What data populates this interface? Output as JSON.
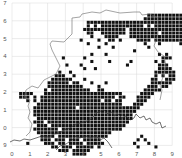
{
  "map": {
    "type": "tetrad distribution map",
    "grid_color": "#d8d8d8",
    "cell_color": "#111111",
    "outline_color": "#555555",
    "x_labels": [
      "0",
      "1",
      "2",
      "3",
      "4",
      "5",
      "6",
      "7",
      "8",
      "9"
    ],
    "y_labels": [
      "7",
      "6",
      "5",
      "4",
      "3",
      "2",
      "1",
      "0",
      "9"
    ],
    "origin": {
      "x": 12,
      "y": 3
    },
    "tick_spacing": 17.8,
    "cells_per_square": 5,
    "rows": [
      {
        "r": 3,
        "c": [
          38,
          39,
          40,
          41,
          42,
          43,
          44,
          45,
          46,
          47
        ]
      },
      {
        "r": 4,
        "c": [
          37,
          38,
          39,
          40,
          41,
          42,
          43,
          44,
          45,
          46,
          47
        ]
      },
      {
        "r": 5,
        "c": [
          21,
          22,
          23,
          24,
          25,
          26,
          27,
          28,
          29,
          30,
          31,
          32,
          33,
          34,
          35,
          36,
          37,
          38,
          39,
          40,
          41,
          42,
          43,
          44,
          45,
          46,
          47
        ]
      },
      {
        "r": 6,
        "c": [
          21,
          23,
          25,
          26,
          27,
          28,
          29,
          30,
          31,
          32,
          33,
          34,
          35,
          36,
          38,
          40,
          41,
          42,
          43,
          44,
          45,
          46,
          47
        ]
      },
      {
        "r": 7,
        "c": [
          20,
          21,
          22,
          23,
          24,
          25,
          26,
          27,
          28,
          29,
          30,
          31,
          33,
          34,
          35,
          36,
          37,
          38,
          39,
          40,
          41,
          42,
          43,
          44,
          45,
          46,
          47
        ]
      },
      {
        "r": 8,
        "c": [
          21,
          22,
          25,
          26,
          27,
          28,
          29,
          30,
          31,
          33,
          34,
          35,
          36,
          37,
          38,
          39,
          40,
          42,
          43,
          44,
          45,
          46,
          47
        ]
      },
      {
        "r": 9,
        "c": [
          22,
          26,
          27,
          28,
          29,
          33,
          34,
          35,
          36,
          37,
          38,
          39,
          40,
          41,
          42,
          43,
          44,
          45,
          46,
          47,
          48
        ]
      },
      {
        "r": 10,
        "c": [
          19,
          24,
          27,
          28,
          30,
          35,
          36,
          37,
          38,
          40,
          41,
          42,
          43,
          44,
          45,
          46,
          47,
          48
        ]
      },
      {
        "r": 11,
        "c": [
          21,
          26,
          37,
          41,
          47
        ]
      },
      {
        "r": 12,
        "c": [
          24,
          28,
          38
        ]
      },
      {
        "r": 13,
        "c": [
          34
        ]
      },
      {
        "r": 14,
        "c": [
          22,
          26,
          41,
          43
        ]
      },
      {
        "r": 15,
        "c": [
          14,
          20,
          42,
          43,
          44
        ]
      },
      {
        "r": 16,
        "c": [
          22,
          27,
          33,
          40,
          42
        ]
      },
      {
        "r": 17,
        "c": [
          15,
          19,
          32,
          41,
          42,
          43
        ]
      },
      {
        "r": 18,
        "c": [
          20,
          23,
          41,
          42,
          43,
          44
        ]
      },
      {
        "r": 19,
        "c": [
          13,
          16,
          40,
          41,
          42,
          43,
          44,
          45
        ]
      },
      {
        "r": 20,
        "c": [
          12,
          13,
          14,
          17,
          40,
          42,
          44,
          45
        ]
      },
      {
        "r": 21,
        "c": [
          11,
          12,
          13,
          14,
          15,
          16,
          20,
          39,
          40,
          43,
          44,
          45
        ]
      },
      {
        "r": 22,
        "c": [
          10,
          11,
          12,
          13,
          14,
          15,
          17,
          18,
          22,
          26,
          39,
          40,
          41,
          42,
          43,
          44
        ]
      },
      {
        "r": 23,
        "c": [
          10,
          11,
          12,
          13,
          14,
          15,
          16,
          17,
          18,
          19,
          24,
          38,
          39,
          40,
          42,
          43
        ]
      },
      {
        "r": 24,
        "c": [
          9,
          11,
          12,
          13,
          14,
          15,
          16,
          17,
          18,
          19,
          20,
          21,
          24,
          25,
          37,
          38,
          39,
          40,
          41
        ]
      },
      {
        "r": 25,
        "c": [
          2,
          3,
          4,
          5,
          9,
          10,
          11,
          12,
          13,
          14,
          15,
          16,
          17,
          18,
          19,
          20,
          21,
          22,
          23,
          24,
          25,
          26,
          27,
          28,
          29,
          30,
          36,
          37,
          38,
          39
        ]
      },
      {
        "r": 26,
        "c": [
          2,
          3,
          4,
          6,
          8,
          9,
          10,
          11,
          12,
          13,
          14,
          15,
          16,
          17,
          18,
          19,
          20,
          21,
          22,
          23,
          24,
          25,
          26,
          27,
          28,
          30,
          31,
          35,
          36,
          37,
          38
        ]
      },
      {
        "r": 27,
        "c": [
          4,
          6,
          8,
          9,
          10,
          11,
          12,
          13,
          14,
          15,
          16,
          17,
          18,
          19,
          20,
          21,
          22,
          23,
          24,
          26,
          27,
          29,
          30,
          35,
          36,
          37
        ]
      },
      {
        "r": 28,
        "c": [
          7,
          8,
          9,
          10,
          11,
          12,
          13,
          14,
          15,
          16,
          17,
          18,
          19,
          20,
          21,
          22,
          23,
          24,
          25,
          26,
          27,
          28,
          29,
          30,
          34,
          35,
          36
        ]
      },
      {
        "r": 29,
        "c": [
          6,
          7,
          8,
          9,
          10,
          11,
          12,
          13,
          14,
          15,
          16,
          17,
          19,
          20,
          21,
          22,
          23,
          24,
          25,
          26,
          27,
          28,
          29,
          30,
          31,
          32,
          33,
          34,
          35
        ]
      },
      {
        "r": 30,
        "c": [
          6,
          7,
          8,
          9,
          10,
          11,
          12,
          13,
          14,
          15,
          16,
          17,
          18,
          19,
          20,
          21,
          22,
          23,
          24,
          25,
          26,
          27,
          28,
          29,
          30,
          31,
          32,
          33,
          34
        ]
      },
      {
        "r": 31,
        "c": [
          6,
          7,
          8,
          9,
          10,
          11,
          12,
          13,
          14,
          15,
          16,
          17,
          18,
          19,
          20,
          21,
          22,
          23,
          24,
          25,
          26,
          27,
          28,
          29,
          30,
          31,
          32,
          33
        ]
      },
      {
        "r": 32,
        "c": [
          7,
          8,
          9,
          10,
          11,
          12,
          13,
          14,
          15,
          16,
          17,
          18,
          19,
          20,
          21,
          22,
          23,
          24,
          25,
          26,
          27,
          28,
          29,
          30,
          31,
          32,
          33
        ]
      },
      {
        "r": 33,
        "c": [
          6,
          7,
          8,
          10,
          11,
          12,
          13,
          14,
          15,
          16,
          17,
          18,
          19,
          20,
          21,
          22,
          23,
          24,
          25,
          26,
          27,
          28,
          29,
          30,
          31,
          32
        ]
      },
      {
        "r": 34,
        "c": [
          7,
          8,
          9,
          11,
          12,
          13,
          14,
          15,
          16,
          17,
          18,
          19,
          20,
          21,
          22,
          23,
          24,
          25,
          26,
          27,
          28,
          29,
          30,
          31
        ]
      },
      {
        "r": 35,
        "c": [
          6,
          7,
          8,
          9,
          10,
          11,
          12,
          14,
          15,
          16,
          17,
          18,
          19,
          20,
          21,
          22,
          23,
          24,
          25,
          26,
          27,
          28,
          29,
          30
        ]
      },
      {
        "r": 36,
        "c": [
          7,
          8,
          9,
          10,
          11,
          12,
          13,
          14,
          15,
          16,
          17,
          18,
          19,
          20,
          21,
          22,
          23,
          24,
          25,
          26,
          27
        ]
      },
      {
        "r": 37,
        "c": [
          8,
          9,
          10,
          11,
          13,
          14,
          15,
          16,
          17,
          18,
          19,
          20,
          21,
          22,
          23,
          24,
          25,
          26,
          36
        ]
      },
      {
        "r": 38,
        "c": [
          8,
          9,
          10,
          12,
          13,
          14,
          16,
          17,
          18,
          20,
          21,
          22,
          23,
          24,
          35,
          37
        ]
      },
      {
        "r": 39,
        "c": [
          4,
          9,
          10,
          11,
          13,
          14,
          16,
          17,
          18,
          19,
          21,
          22,
          23,
          24,
          25,
          34,
          38
        ]
      },
      {
        "r": 40,
        "c": [
          11,
          12,
          14,
          15,
          16,
          18,
          19,
          20,
          21,
          22,
          24,
          35,
          40
        ]
      },
      {
        "r": 41,
        "c": [
          13,
          14,
          15,
          17,
          18,
          19,
          20,
          21
        ]
      },
      {
        "r": 42,
        "c": [
          17,
          18,
          19,
          20
        ]
      }
    ]
  }
}
